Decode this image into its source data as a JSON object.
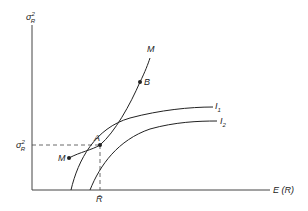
{
  "diagram": {
    "y_axis_label": "σ",
    "y_axis_sup": "2",
    "y_axis_sub": "R",
    "x_axis_label": "E (R)",
    "point_A": "A",
    "point_B": "B",
    "curve_M_top": "M",
    "curve_M_bottom": "M",
    "curve_I1": "I",
    "curve_I1_sub": "1",
    "curve_I2": "I",
    "curve_I2_sub": "2",
    "tick_y": "σ",
    "tick_y_sup": "2",
    "tick_y_sub": "R",
    "tick_x": "R̄"
  }
}
